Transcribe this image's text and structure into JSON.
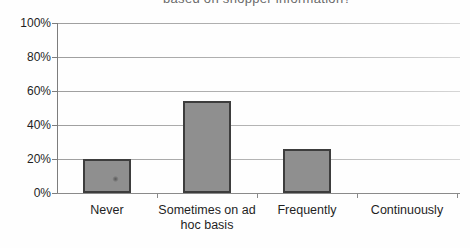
{
  "chart_data": {
    "type": "bar",
    "title": "based on shopper information?",
    "title_note": "title partially clipped at top edge of image",
    "categories": [
      "Never",
      "Sometimes on ad hoc basis",
      "Frequently",
      "Continuously"
    ],
    "values": [
      20,
      54,
      26,
      0
    ],
    "xlabel": "",
    "ylabel": "",
    "ylim": [
      0,
      100
    ],
    "ytick_step": 20,
    "ytick_labels": [
      "0%",
      "20%",
      "40%",
      "60%",
      "80%",
      "100%"
    ],
    "grid": true,
    "legend": "none",
    "colors": {
      "bar_fill": "#8f8f8f",
      "bar_border": "#3d3d3d",
      "gridline": "#b3b3b3",
      "axis": "#7d7d7d",
      "text": "#1f1f1f",
      "background": "#fefefe"
    }
  }
}
